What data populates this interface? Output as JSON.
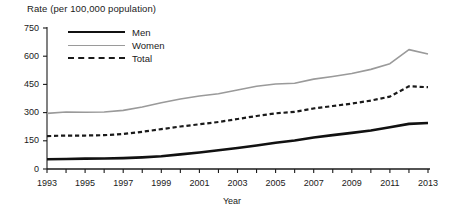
{
  "chart_data": {
    "type": "line",
    "title": "Rate (per 100,000 population)",
    "xlabel": "Year",
    "ylabel": "Rate (per 100,000 population)",
    "xlim": [
      1993,
      2013
    ],
    "ylim": [
      0,
      750
    ],
    "yticks": [
      0,
      150,
      300,
      450,
      600,
      750
    ],
    "ytick_labels": [
      "0",
      "150",
      "300",
      "450",
      "600",
      "750"
    ],
    "xticks": [
      1993,
      1995,
      1997,
      1999,
      2001,
      2003,
      2005,
      2007,
      2009,
      2011,
      2013
    ],
    "xtick_labels": [
      "1993",
      "1995",
      "1997",
      "1999",
      "2001",
      "2003",
      "2005",
      "2007",
      "2009",
      "2011",
      "2013"
    ],
    "x": [
      1993,
      1994,
      1995,
      1996,
      1997,
      1998,
      1999,
      2000,
      2001,
      2002,
      2003,
      2004,
      2005,
      2006,
      2007,
      2008,
      2009,
      2010,
      2011,
      2012,
      2013
    ],
    "grid": false,
    "legend_position": "upper-left",
    "series": [
      {
        "name": "Men",
        "color": "#111111",
        "style": "solid",
        "width": 2.6,
        "values": [
          52,
          53,
          55,
          56,
          58,
          62,
          68,
          78,
          88,
          100,
          112,
          125,
          140,
          152,
          168,
          180,
          192,
          205,
          222,
          240,
          245
        ]
      },
      {
        "name": "Women",
        "color": "#9a9a9a",
        "style": "solid",
        "width": 1.6,
        "values": [
          296,
          303,
          302,
          303,
          312,
          330,
          352,
          372,
          388,
          400,
          420,
          440,
          452,
          456,
          478,
          492,
          508,
          530,
          560,
          635,
          612
        ]
      },
      {
        "name": "Total",
        "color": "#1a1a1a",
        "style": "dashed",
        "width": 2.2,
        "values": [
          175,
          178,
          178,
          180,
          186,
          198,
          212,
          226,
          238,
          250,
          266,
          282,
          296,
          304,
          322,
          335,
          348,
          364,
          385,
          440,
          435
        ]
      }
    ]
  },
  "legend": {
    "items": [
      {
        "label": "Men"
      },
      {
        "label": "Women"
      },
      {
        "label": "Total"
      }
    ]
  },
  "axis": {
    "line_color": "#1a1a1a"
  }
}
